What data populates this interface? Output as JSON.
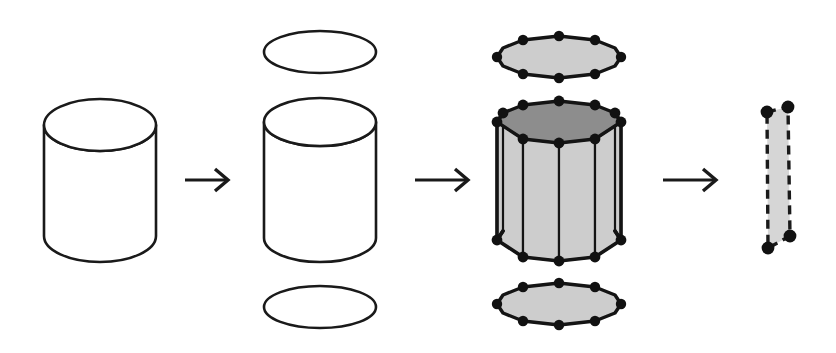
{
  "figure": {
    "background_color": "#ffffff",
    "width": 836,
    "height": 353,
    "stroke_color": "#1a1a1a",
    "face_light_color": "#cdcdcd",
    "face_dark_color": "#8d8d8d",
    "patch_fill_color": "#d6d6d6",
    "vertex_color": "#111111"
  },
  "stages": [
    {
      "index": 1,
      "name": "solid-cylinder",
      "label": "Solid cylinder",
      "description": "Closed smooth cylinder primitive drawn as outline only",
      "parts": [
        "top-ellipse",
        "side-tube",
        "bottom-arc"
      ],
      "fill": "none",
      "center_x": 100,
      "center_y": 180,
      "radius_x": 56,
      "radius_y": 26,
      "top_y": 125,
      "bottom_y": 236
    },
    {
      "index": 2,
      "name": "exploded-cylinder",
      "label": "Exploded into cap, tube and cap",
      "description": "Cylinder separated into detached top disc, open tube and bottom disc",
      "parts": [
        "top-cap-ellipse",
        "open-tube",
        "bottom-cap-ellipse"
      ],
      "fill": "none",
      "center_x": 320,
      "top_cap_cy": 52,
      "bottom_cap_cy": 307,
      "radius_x": 56,
      "radius_y": 22,
      "tube_center_y": 180,
      "tube_top_y": 122,
      "tube_bottom_y": 238
    },
    {
      "index": 3,
      "name": "tessellated-prism",
      "label": "Tessellated decagonal prism",
      "description": "Caps become filled polygons and tube becomes a ring of quad faces with visible vertices",
      "parts": [
        "top-cap-polygon",
        "prism-body",
        "bottom-cap-polygon"
      ],
      "segments": 10,
      "fill_side": "#cdcdcd",
      "fill_top": "#8d8d8d",
      "fill_cap": "#cdcdcd",
      "center_x": 559,
      "top_cap_cy": 57,
      "bottom_cap_cy": 304,
      "radius_x": 62,
      "radius_y": 21,
      "body_top_y": 122,
      "body_bottom_y": 240,
      "vertex_radius": 5.2
    },
    {
      "index": 4,
      "name": "single-quad-face",
      "label": "Single extracted quad face",
      "description": "One quadrilateral side face isolated with dashed edges and four corner vertices",
      "vertices": 4,
      "fill": "#d6d6d6",
      "edge_style": "dashed",
      "corners": [
        [
          767,
          112
        ],
        [
          788,
          107
        ],
        [
          790,
          236
        ],
        [
          768,
          248
        ]
      ],
      "vertex_radius": 6.4
    }
  ],
  "arrows": [
    {
      "name": "arrow-stage-1-to-2",
      "label": "to exploded form",
      "x1": 185,
      "x2": 228,
      "y": 180,
      "direction": "right"
    },
    {
      "name": "arrow-stage-2-to-3",
      "label": "to tessellated form",
      "x1": 415,
      "x2": 468,
      "y": 180,
      "direction": "right"
    },
    {
      "name": "arrow-stage-3-to-4",
      "label": "to single face",
      "x1": 663,
      "x2": 716,
      "y": 180,
      "direction": "right"
    }
  ]
}
